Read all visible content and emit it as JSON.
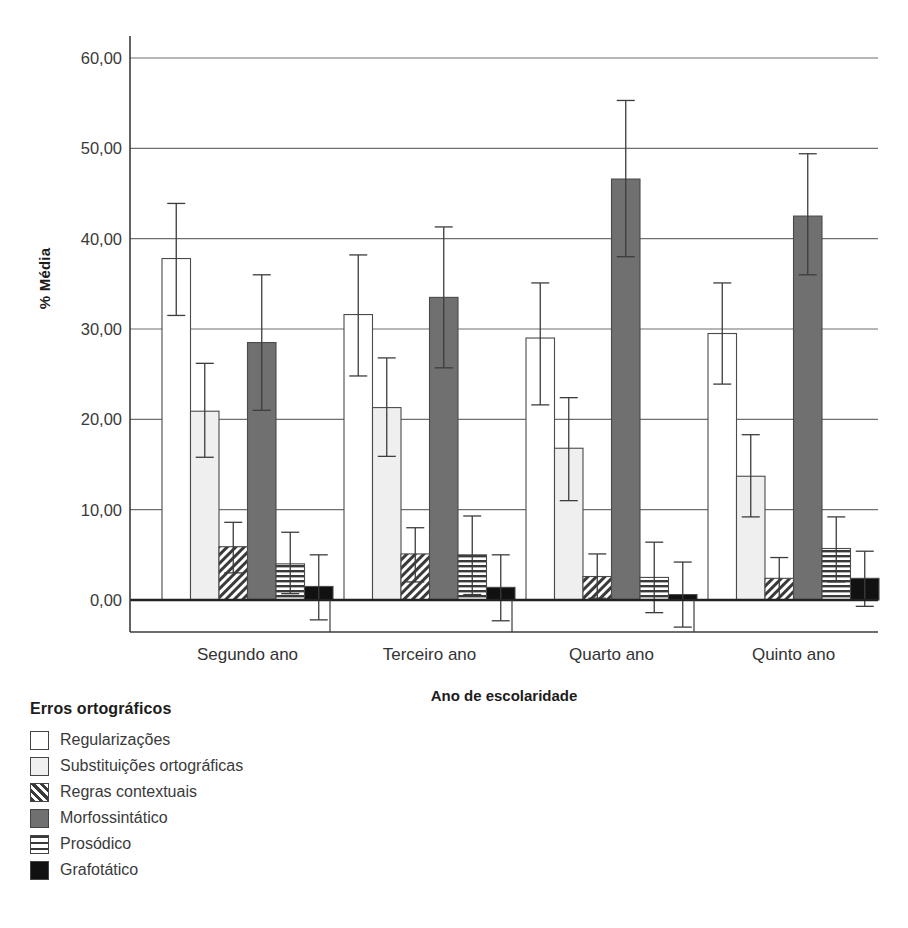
{
  "chart_data": {
    "type": "bar",
    "title": "",
    "xlabel": "Ano de escolaridade",
    "ylabel": "% Média",
    "categories": [
      "Segundo ano",
      "Terceiro ano",
      "Quarto ano",
      "Quinto ano"
    ],
    "ylim": [
      0,
      60
    ],
    "yticks": [
      0,
      10,
      20,
      30,
      40,
      50,
      60
    ],
    "ytick_labels": [
      "0,00",
      "10,00",
      "20,00",
      "30,00",
      "40,00",
      "50,00",
      "60,00"
    ],
    "grid": true,
    "legend_position": "below-left",
    "legend_title": "Erros ortográficos",
    "error_bars": "95% CI",
    "series": [
      {
        "name": "Regularizações",
        "fill": "white",
        "values": [
          37.8,
          31.6,
          29.0,
          29.5
        ],
        "err_low": [
          31.5,
          24.8,
          21.6,
          23.9
        ],
        "err_high": [
          43.9,
          38.2,
          35.1,
          35.1
        ]
      },
      {
        "name": "Substituições ortográficas",
        "fill": "light-gray",
        "values": [
          20.9,
          21.3,
          16.8,
          13.7
        ],
        "err_low": [
          15.8,
          15.9,
          11.0,
          9.2
        ],
        "err_high": [
          26.2,
          26.8,
          22.4,
          18.3
        ]
      },
      {
        "name": "Regras contextuais",
        "fill": "diagonal-hatch",
        "values": [
          5.9,
          5.1,
          2.6,
          2.4
        ],
        "err_low": [
          3.0,
          2.0,
          0.2,
          0.0
        ],
        "err_high": [
          8.6,
          8.0,
          5.1,
          4.7
        ]
      },
      {
        "name": "Morfossintático",
        "fill": "dark-gray",
        "values": [
          28.5,
          33.5,
          46.6,
          42.5
        ],
        "err_low": [
          21.0,
          25.7,
          38.0,
          36.0
        ],
        "err_high": [
          36.0,
          41.3,
          55.3,
          49.4
        ]
      },
      {
        "name": "Prosódico",
        "fill": "horizontal-lines",
        "values": [
          4.0,
          5.0,
          2.5,
          5.7
        ],
        "err_low": [
          0.7,
          0.6,
          -1.4,
          2.0
        ],
        "err_high": [
          7.5,
          9.3,
          6.4,
          9.2
        ]
      },
      {
        "name": "Grafotático",
        "fill": "black",
        "values": [
          1.5,
          1.4,
          0.6,
          2.4
        ],
        "err_low": [
          -2.2,
          -2.3,
          -3.0,
          -0.7
        ],
        "err_high": [
          5.0,
          5.0,
          4.2,
          5.4
        ]
      }
    ]
  },
  "colors": {
    "white": "#ffffff",
    "light_gray": "#efefef",
    "dark_gray": "#707070",
    "black": "#111111",
    "outline": "#4a4a4a",
    "grid": "#6f6f6f",
    "axis": "#3c3c3c",
    "text": "#333333"
  }
}
